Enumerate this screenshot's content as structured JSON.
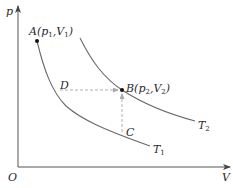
{
  "diagram": {
    "type": "p-V isotherm diagram",
    "axes": {
      "y_label": "p",
      "x_label": "V",
      "origin_label": "O"
    },
    "curves": [
      {
        "id": "T1",
        "label": "T",
        "subscript": "1",
        "color": "#666666"
      },
      {
        "id": "T2",
        "label": "T",
        "subscript": "2",
        "color": "#666666"
      }
    ],
    "points": {
      "A": {
        "text": "A(p",
        "sub1": "1",
        "mid": ",V",
        "sub2": "1",
        "end": ")"
      },
      "B": {
        "text": "B(p",
        "sub1": "2",
        "mid": ",V",
        "sub2": "2",
        "end": ")"
      },
      "C": {
        "text": "C"
      },
      "D": {
        "text": "D"
      }
    },
    "colors": {
      "axis": "#555555",
      "curve": "#6a6a6a",
      "dashed": "#b0b0b0",
      "point": "#111111",
      "text": "#2a2a2a"
    }
  }
}
